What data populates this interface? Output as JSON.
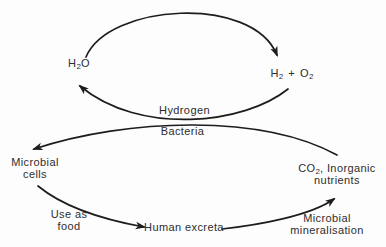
{
  "colors": {
    "background": "#fdfdfd",
    "ink": "#1d1d1d",
    "text": "#2d2d2d"
  },
  "nodes": {
    "h2o": {
      "p1": "H",
      "sub": "2",
      "p2": "O"
    },
    "h2_plus_o2": {
      "p1": "H",
      "s1": "2",
      "plus": "+",
      "p2": "O",
      "s2": "2"
    },
    "hydrogen_bacteria": {
      "line1": "Hydrogen",
      "line2": "Bacteria"
    },
    "microbial_cells": {
      "line1": "Microbial",
      "line2": "cells"
    },
    "co2_nutrients": {
      "p1": "CO",
      "sub": "2",
      "p2": ", Inorganic",
      "line2": "nutrients"
    },
    "human_excreta": {
      "label": "Human excreta"
    }
  },
  "edge_labels": {
    "use_as_food": {
      "line1": "Use as",
      "line2": "food"
    },
    "microbial_mineralisation": {
      "line1": "Microbial",
      "line2": "mineralisation"
    }
  },
  "edges": [
    {
      "from": "H2O",
      "to": "H2 + O2"
    },
    {
      "from": "H2 + O2",
      "to": "H2O",
      "via": "Hydrogen Bacteria"
    },
    {
      "from": "CO2, Inorganic nutrients",
      "to": "Microbial cells",
      "via": "Hydrogen Bacteria"
    },
    {
      "from": "Microbial cells",
      "to": "Human excreta",
      "label": "Use as food"
    },
    {
      "from": "Human excreta",
      "to": "CO2, Inorganic nutrients",
      "label": "Microbial mineralisation"
    }
  ]
}
